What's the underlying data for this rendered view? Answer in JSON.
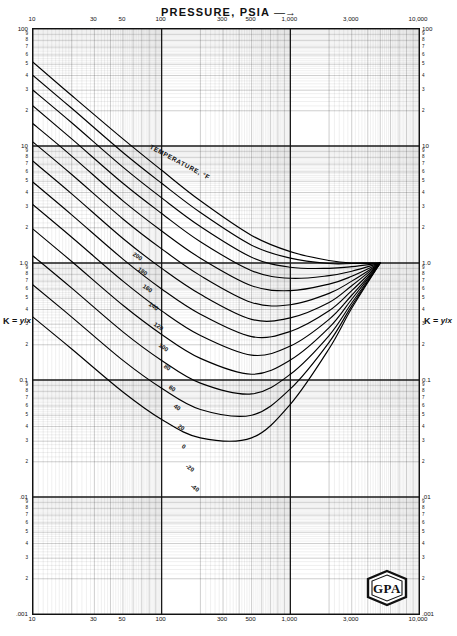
{
  "chart_title": "PRESSURE, PSIA",
  "title_arrow": "—→",
  "axis_label_k": {
    "prefix": "K = ",
    "num": "y",
    "den": "x",
    "sep": "/"
  },
  "temperature_header": "TEMPERATURE, °F",
  "logo_text": "GPA",
  "chart_data": {
    "type": "line",
    "title": "PRESSURE, PSIA",
    "xlabel": "PRESSURE, PSIA",
    "ylabel": "K = y/x",
    "xscale": "log",
    "yscale": "log",
    "xlim": [
      10,
      10000
    ],
    "ylim": [
      0.001,
      100
    ],
    "grid": true,
    "legend": "inline-curve-labels",
    "xtick_labels": [
      "10",
      "30",
      "50",
      "100",
      "300",
      "500",
      "1,000",
      "3,000",
      "10,000"
    ],
    "xtick_values": [
      10,
      30,
      50,
      100,
      300,
      500,
      1000,
      3000,
      10000
    ],
    "ytick_labels": [
      "100",
      "10",
      "1.0",
      "0.1",
      ".01",
      ".001"
    ],
    "ytick_values": [
      100,
      10,
      1.0,
      0.1,
      0.01,
      0.001
    ],
    "yminor_labels": [
      "9",
      "8",
      "7",
      "6",
      "5",
      "4",
      "3",
      "2"
    ],
    "annotation": "TEMPERATURE, °F",
    "convergence_point": {
      "pressure": 5000,
      "k": 1.0
    },
    "series": [
      {
        "name": "200",
        "label": "200",
        "points": [
          [
            10,
            52
          ],
          [
            20,
            27
          ],
          [
            50,
            11.5
          ],
          [
            100,
            6.2
          ],
          [
            200,
            3.4
          ],
          [
            500,
            1.72
          ],
          [
            1000,
            1.25
          ],
          [
            2000,
            1.05
          ],
          [
            3000,
            1.0
          ],
          [
            5000,
            1.0
          ]
        ]
      },
      {
        "name": "180",
        "label": "180",
        "points": [
          [
            10,
            40
          ],
          [
            20,
            21
          ],
          [
            50,
            8.8
          ],
          [
            100,
            4.8
          ],
          [
            200,
            2.7
          ],
          [
            500,
            1.42
          ],
          [
            1000,
            1.1
          ],
          [
            2000,
            0.99
          ],
          [
            3000,
            0.99
          ],
          [
            5000,
            1.0
          ]
        ]
      },
      {
        "name": "160",
        "label": "160",
        "points": [
          [
            10,
            30
          ],
          [
            20,
            15.8
          ],
          [
            50,
            6.6
          ],
          [
            100,
            3.6
          ],
          [
            200,
            2.05
          ],
          [
            500,
            1.12
          ],
          [
            1000,
            0.92
          ],
          [
            2000,
            0.9
          ],
          [
            3000,
            0.93
          ],
          [
            5000,
            1.0
          ]
        ]
      },
      {
        "name": "140",
        "label": "140",
        "points": [
          [
            10,
            22
          ],
          [
            20,
            11.5
          ],
          [
            50,
            4.8
          ],
          [
            100,
            2.65
          ],
          [
            200,
            1.52
          ],
          [
            500,
            0.86
          ],
          [
            1000,
            0.74
          ],
          [
            2000,
            0.78
          ],
          [
            3000,
            0.85
          ],
          [
            5000,
            1.0
          ]
        ]
      },
      {
        "name": "120",
        "label": "120",
        "points": [
          [
            10,
            15.5
          ],
          [
            20,
            8.2
          ],
          [
            50,
            3.4
          ],
          [
            100,
            1.88
          ],
          [
            200,
            1.1
          ],
          [
            500,
            0.64
          ],
          [
            1000,
            0.58
          ],
          [
            2000,
            0.66
          ],
          [
            3000,
            0.77
          ],
          [
            5000,
            1.0
          ]
        ]
      },
      {
        "name": "100",
        "label": "100",
        "points": [
          [
            10,
            10.8
          ],
          [
            20,
            5.7
          ],
          [
            50,
            2.38
          ],
          [
            100,
            1.32
          ],
          [
            200,
            0.78
          ],
          [
            500,
            0.46
          ],
          [
            1000,
            0.44
          ],
          [
            2000,
            0.55
          ],
          [
            3000,
            0.7
          ],
          [
            5000,
            1.0
          ]
        ]
      },
      {
        "name": "80",
        "label": "80",
        "points": [
          [
            10,
            7.4
          ],
          [
            20,
            3.9
          ],
          [
            50,
            1.62
          ],
          [
            100,
            0.9
          ],
          [
            200,
            0.54
          ],
          [
            500,
            0.33
          ],
          [
            1000,
            0.34
          ],
          [
            2000,
            0.46
          ],
          [
            3000,
            0.64
          ],
          [
            5000,
            1.0
          ]
        ]
      },
      {
        "name": "60",
        "label": "60",
        "points": [
          [
            10,
            4.9
          ],
          [
            20,
            2.58
          ],
          [
            50,
            1.08
          ],
          [
            100,
            0.6
          ],
          [
            200,
            0.365
          ],
          [
            500,
            0.235
          ],
          [
            1000,
            0.26
          ],
          [
            2000,
            0.39
          ],
          [
            3000,
            0.58
          ],
          [
            5000,
            1.0
          ]
        ]
      },
      {
        "name": "40",
        "label": "40",
        "points": [
          [
            10,
            3.15
          ],
          [
            20,
            1.66
          ],
          [
            50,
            0.7
          ],
          [
            100,
            0.39
          ],
          [
            200,
            0.24
          ],
          [
            500,
            0.163
          ],
          [
            1000,
            0.195
          ],
          [
            2000,
            0.33
          ],
          [
            3000,
            0.53
          ],
          [
            5000,
            1.0
          ]
        ]
      },
      {
        "name": "20",
        "label": "20",
        "points": [
          [
            10,
            1.95
          ],
          [
            20,
            1.03
          ],
          [
            50,
            0.435
          ],
          [
            100,
            0.245
          ],
          [
            200,
            0.153
          ],
          [
            500,
            0.112
          ],
          [
            1000,
            0.148
          ],
          [
            2000,
            0.28
          ],
          [
            3000,
            0.49
          ],
          [
            5000,
            1.0
          ]
        ]
      },
      {
        "name": "0",
        "label": "0",
        "points": [
          [
            10,
            1.15
          ],
          [
            20,
            0.61
          ],
          [
            50,
            0.258
          ],
          [
            100,
            0.147
          ],
          [
            200,
            0.094
          ],
          [
            500,
            0.076
          ],
          [
            1000,
            0.112
          ],
          [
            2000,
            0.24
          ],
          [
            3000,
            0.455
          ],
          [
            5000,
            1.0
          ]
        ]
      },
      {
        "name": "-20",
        "label": "-20",
        "points": [
          [
            10,
            0.65
          ],
          [
            20,
            0.345
          ],
          [
            50,
            0.147
          ],
          [
            100,
            0.085
          ],
          [
            200,
            0.056
          ],
          [
            500,
            0.05
          ],
          [
            1000,
            0.084
          ],
          [
            2000,
            0.21
          ],
          [
            3000,
            0.43
          ],
          [
            5000,
            1.0
          ]
        ]
      },
      {
        "name": "-40",
        "label": "-40",
        "points": [
          [
            10,
            0.345
          ],
          [
            20,
            0.184
          ],
          [
            50,
            0.079
          ],
          [
            100,
            0.046
          ],
          [
            200,
            0.032
          ],
          [
            500,
            0.032
          ],
          [
            1000,
            0.062
          ],
          [
            2000,
            0.185
          ],
          [
            3000,
            0.41
          ],
          [
            5000,
            1.0
          ]
        ]
      }
    ]
  }
}
